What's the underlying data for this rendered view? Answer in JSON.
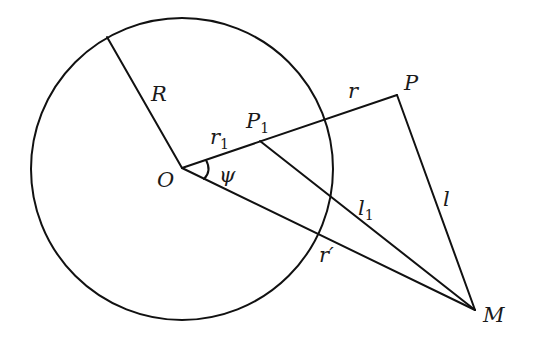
{
  "diagram": {
    "type": "geometry",
    "colors": {
      "stroke": "#111111",
      "background": "#ffffff",
      "text": "#1a1a1a"
    },
    "points": {
      "O": {
        "label": "O",
        "x": 182,
        "y": 168
      },
      "P": {
        "label": "P",
        "x": 397,
        "y": 95
      },
      "P1": {
        "label": "P",
        "sub": "1",
        "x": 260,
        "y": 141
      },
      "M": {
        "label": "M",
        "x": 475,
        "y": 310
      },
      "Rend": {
        "x": 107,
        "y": 37
      }
    },
    "circle": {
      "cx": 182,
      "cy": 169,
      "r": 151
    },
    "labels": {
      "R": "R",
      "r1_main": "r",
      "r1_sub": "1",
      "r": "r",
      "psi": "ψ",
      "O": "O",
      "P": "P",
      "P1_main": "P",
      "P1_sub": "1",
      "l1_main": "l",
      "l1_sub": "1",
      "l": "l",
      "r_prime": "r′",
      "M": "M"
    }
  }
}
